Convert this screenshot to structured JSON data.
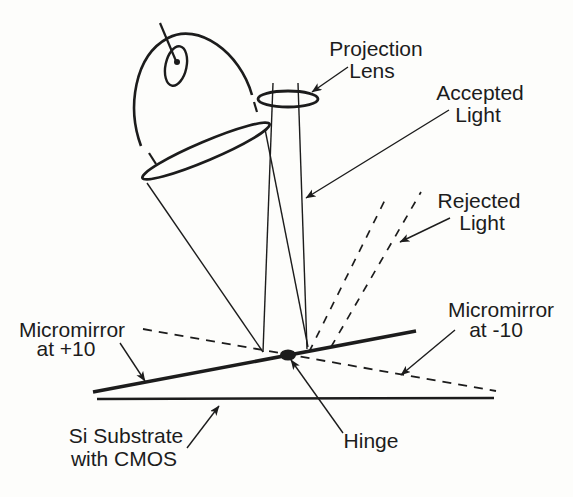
{
  "figure": {
    "type": "optical-schematic",
    "components": [
      "lamp-bulb",
      "lamp-filament",
      "condenser-lens",
      "projection-lens",
      "accepted-light-cone",
      "rejected-light-rays",
      "micromirror-plus-10",
      "micromirror-minus-10",
      "hinge",
      "si-substrate"
    ]
  },
  "labels": {
    "projection_lens": {
      "line1": "Projection",
      "line2": "Lens"
    },
    "accepted_light": {
      "line1": "Accepted",
      "line2": "Light"
    },
    "rejected_light": {
      "line1": "Rejected",
      "line2": "Light"
    },
    "micromirror_plus": {
      "line1": "Micromirror",
      "line2": "at +10"
    },
    "micromirror_minus": {
      "line1": "Micromirror",
      "line2": "at -10"
    },
    "si_substrate": {
      "line1": "Si Substrate",
      "line2": "with CMOS"
    },
    "hinge": {
      "text": "Hinge"
    }
  },
  "colors": {
    "ink": "#1c1c1c",
    "background": "#fdfdfb"
  }
}
